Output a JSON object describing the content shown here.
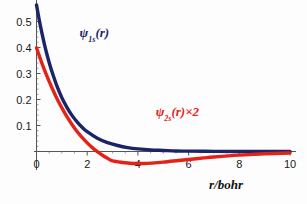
{
  "chart_data": {
    "type": "line",
    "title": "",
    "subtitle": "",
    "xlabel": "r/bohr",
    "ylabel": "",
    "xlim": [
      0,
      10
    ],
    "ylim": [
      -0.06,
      0.58
    ],
    "grid": false,
    "legend_position": "inline-annotations",
    "xticks": [
      "0",
      "2",
      "4",
      "6",
      "8",
      "10"
    ],
    "xtick_values": [
      0,
      2,
      4,
      6,
      8,
      10
    ],
    "yticks": [
      "0.1",
      "0.2",
      "0.3",
      "0.4",
      "0.5"
    ],
    "ytick_values": [
      0.1,
      0.2,
      0.3,
      0.4,
      0.5
    ],
    "series": [
      {
        "name": "psi_1s(r)",
        "label_html": "ψ<sub>1s</sub>(r)",
        "label_main": "ψ",
        "label_sub": "1s",
        "label_tail": "(r)",
        "color": "#1c2468",
        "x": [
          0,
          0.1,
          0.2,
          0.3,
          0.4,
          0.5,
          0.6,
          0.8,
          1.0,
          1.2,
          1.4,
          1.6,
          1.8,
          2.0,
          2.4,
          2.8,
          3.2,
          3.6,
          4.0,
          4.5,
          5.0,
          5.5,
          6.0,
          7.0,
          8.0,
          9.0,
          10.0
        ],
        "y": [
          0.564,
          0.51,
          0.462,
          0.418,
          0.378,
          0.342,
          0.31,
          0.253,
          0.207,
          0.17,
          0.139,
          0.114,
          0.093,
          0.076,
          0.051,
          0.034,
          0.023,
          0.015,
          0.01,
          0.006,
          0.004,
          0.002,
          0.0014,
          0.0005,
          0.0002,
          0.0001,
          4e-05
        ]
      },
      {
        "name": "psi_2s(r)x2",
        "label_html": "ψ<sub>2s</sub>(r)×2",
        "label_main": "ψ",
        "label_sub": "2s",
        "label_tail": "(r)×2",
        "color": "#e42217",
        "x": [
          0,
          0.2,
          0.4,
          0.6,
          0.8,
          1.0,
          1.2,
          1.4,
          1.6,
          1.8,
          2.0,
          2.2,
          2.4,
          2.6,
          2.8,
          3.0,
          3.4,
          3.8,
          4.0,
          4.4,
          5.0,
          5.6,
          6.0,
          6.6,
          7.0,
          8.0,
          9.0,
          10.0
        ],
        "y": [
          0.399,
          0.343,
          0.293,
          0.247,
          0.205,
          0.168,
          0.134,
          0.104,
          0.077,
          0.054,
          0.033,
          0.015,
          -0.0006,
          -0.0143,
          -0.0261,
          -0.0363,
          -0.0422,
          -0.0459,
          -0.0464,
          -0.0455,
          -0.041,
          -0.0347,
          -0.0307,
          -0.0247,
          -0.021,
          -0.014,
          -0.0089,
          -0.0055
        ]
      }
    ],
    "annotations": [
      {
        "text": "ψ₁ₛ(r)",
        "color": "#1c2468",
        "x": 1.7,
        "y": 0.44
      },
      {
        "text": "ψ₂ₛ(r)×2",
        "color": "#e42217",
        "x": 4.7,
        "y": 0.135
      }
    ]
  },
  "axis": {
    "x_axis_color": "#555555",
    "y_axis_color": "#555555",
    "x_title": "r/bohr"
  }
}
